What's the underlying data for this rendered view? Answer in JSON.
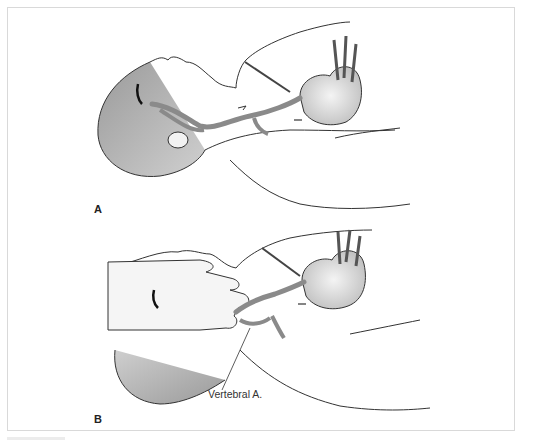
{
  "figure": {
    "panels": [
      {
        "id": "A",
        "label": "A",
        "description": "Supine patient, head turned, carotid/vertebral vessels and heart shown"
      },
      {
        "id": "B",
        "label": "B",
        "description": "Examiner's hand on neck compressing vessels"
      }
    ],
    "callouts": [
      {
        "panel": "B",
        "text": "Vertebral A."
      }
    ],
    "colors": {
      "frame_border": "#d9d9d9",
      "line_art": "#333333",
      "vessel": "#8a8a8a",
      "shading": "#bdbdbd"
    }
  }
}
